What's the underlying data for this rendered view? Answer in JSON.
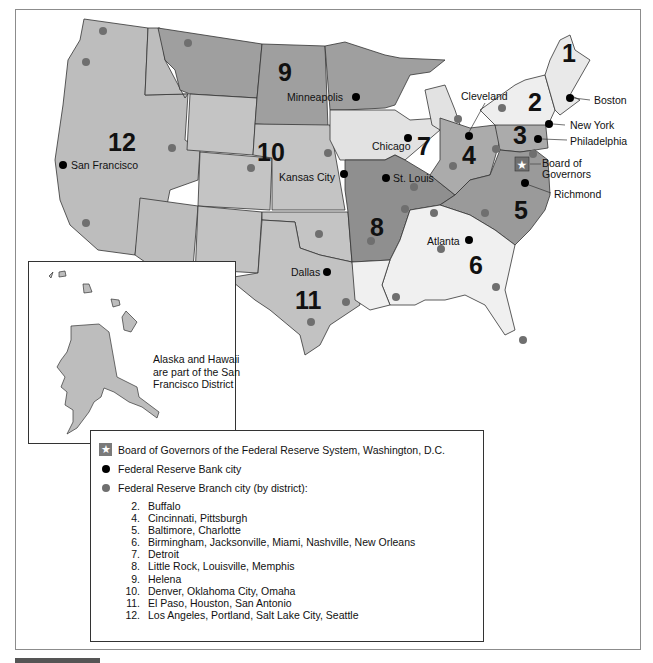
{
  "map": {
    "title": "Federal Reserve Districts",
    "colors": {
      "district_light": "#ebebeb",
      "district_mid": "#bdbdbd",
      "district_mid2": "#a9a9a9",
      "district_dark": "#8f8f8f",
      "bank_city": "#000000",
      "branch_city": "#6f6f6f",
      "outline": "#333333"
    },
    "district_numbers": [
      {
        "num": "1"
      },
      {
        "num": "2"
      },
      {
        "num": "3"
      },
      {
        "num": "4"
      },
      {
        "num": "5"
      },
      {
        "num": "6"
      },
      {
        "num": "7"
      },
      {
        "num": "8"
      },
      {
        "num": "9"
      },
      {
        "num": "10"
      },
      {
        "num": "11"
      },
      {
        "num": "12"
      }
    ],
    "bank_cities": [
      {
        "name": "Boston"
      },
      {
        "name": "New York"
      },
      {
        "name": "Philadelphia"
      },
      {
        "name": "Cleveland"
      },
      {
        "name": "Richmond"
      },
      {
        "name": "Atlanta"
      },
      {
        "name": "Chicago"
      },
      {
        "name": "St. Louis"
      },
      {
        "name": "Minneapolis"
      },
      {
        "name": "Kansas City"
      },
      {
        "name": "Dallas"
      },
      {
        "name": "San Francisco"
      }
    ],
    "board_label_line1": "Board of",
    "board_label_line2": "Governors"
  },
  "inset": {
    "note_line1": "Alaska and Hawaii",
    "note_line2": "are part of the San",
    "note_line3": "Francisco District"
  },
  "legend": {
    "board": "Board of Governors of the Federal Reserve System, Washington, D.C.",
    "bank": "Federal Reserve Bank city",
    "branch": "Federal Reserve Branch city (by district):",
    "branches": [
      {
        "num": "2.",
        "cities": "Buffalo"
      },
      {
        "num": "4.",
        "cities": "Cincinnati, Pittsburgh"
      },
      {
        "num": "5.",
        "cities": "Baltimore, Charlotte"
      },
      {
        "num": "6.",
        "cities": "Birmingham, Jacksonville, Miami, Nashville, New Orleans"
      },
      {
        "num": "7.",
        "cities": "Detroit"
      },
      {
        "num": "8.",
        "cities": "Little Rock, Louisville, Memphis"
      },
      {
        "num": "9.",
        "cities": "Helena"
      },
      {
        "num": "10.",
        "cities": "Denver, Oklahoma City, Omaha"
      },
      {
        "num": "11.",
        "cities": "El Paso, Houston, San Antonio"
      },
      {
        "num": "12.",
        "cities": "Los Angeles, Portland, Salt Lake City, Seattle"
      }
    ]
  }
}
